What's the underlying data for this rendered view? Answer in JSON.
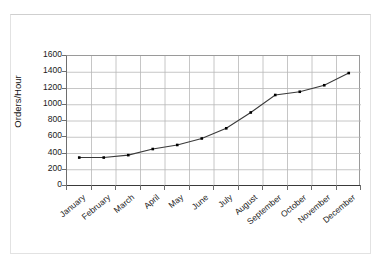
{
  "chart_data": {
    "type": "line",
    "title": "",
    "xlabel": "",
    "ylabel": "Orders/Hour",
    "categories": [
      "January",
      "February",
      "March",
      "April",
      "May",
      "June",
      "July",
      "August",
      "September",
      "October",
      "November",
      "December"
    ],
    "values": [
      350,
      350,
      380,
      455,
      505,
      585,
      710,
      905,
      1120,
      1160,
      1240,
      1390
    ],
    "series": [
      {
        "name": "Orders/Hour",
        "values": [
          350,
          350,
          380,
          455,
          505,
          585,
          710,
          905,
          1120,
          1160,
          1240,
          1390
        ]
      }
    ],
    "ylim": [
      0,
      1600
    ],
    "y_ticks": [
      0,
      200,
      400,
      600,
      800,
      1000,
      1200,
      1400,
      1600
    ],
    "y_tick_labels": [
      "0",
      "200",
      "400",
      "600",
      "800",
      "1000",
      "1200",
      "1400",
      "1600"
    ],
    "grid": true,
    "grid_axis": "both",
    "legend": false,
    "legend_position": "none",
    "marker": "square",
    "marker_color": "#000000",
    "line_color": "#3a3a3a",
    "plot_background": "#ffffff",
    "grid_color": "#b8b8b8",
    "axis_color": "#5a5a5a",
    "x_tick_label_rotation": -40
  }
}
